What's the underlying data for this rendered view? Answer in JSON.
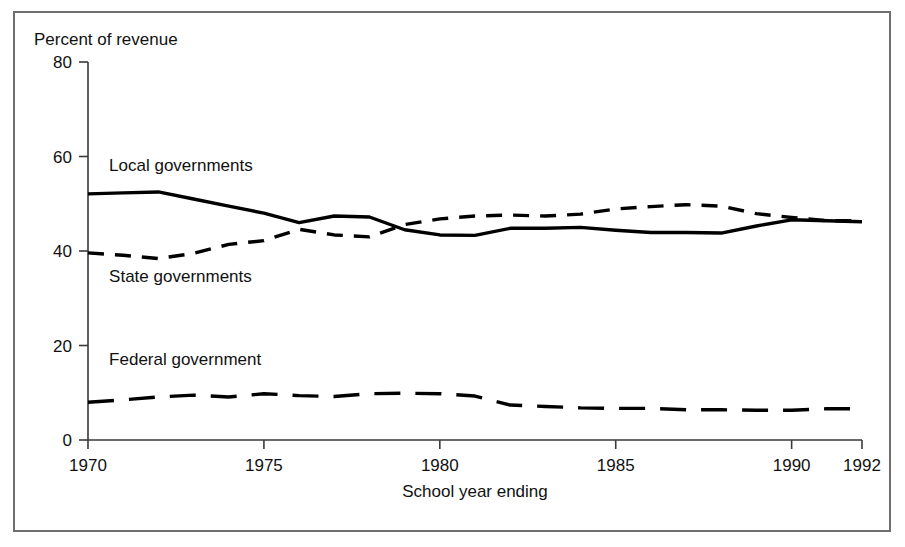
{
  "chart_data": {
    "type": "line",
    "title": "",
    "subtitle": "",
    "ylabel": "Percent of revenue",
    "xlabel": "School year ending",
    "xlim": [
      1970,
      1992
    ],
    "ylim": [
      0,
      80
    ],
    "xticks": [
      "1970",
      "1975",
      "1980",
      "1985",
      "1990",
      "1992"
    ],
    "xtick_values": [
      1970,
      1975,
      1980,
      1985,
      1990,
      1992
    ],
    "yticks": [
      "0",
      "20",
      "40",
      "60",
      "80"
    ],
    "ytick_values": [
      0,
      20,
      40,
      60,
      80
    ],
    "grid": false,
    "legend_position": "inline-annotations",
    "x": [
      1970,
      1971,
      1972,
      1973,
      1974,
      1975,
      1976,
      1977,
      1978,
      1979,
      1980,
      1981,
      1982,
      1983,
      1984,
      1985,
      1986,
      1987,
      1988,
      1989,
      1990,
      1991,
      1992
    ],
    "series": [
      {
        "name": "Local governments",
        "style": "solid",
        "color": "#000000",
        "values": [
          52.1,
          52.3,
          52.5,
          51.0,
          49.5,
          48.0,
          46.0,
          47.4,
          47.2,
          44.5,
          43.4,
          43.3,
          44.8,
          44.8,
          45.0,
          44.4,
          43.9,
          43.9,
          43.8,
          45.3,
          46.6,
          46.4,
          46.2
        ]
      },
      {
        "name": "State governments",
        "style": "dashed",
        "color": "#000000",
        "values": [
          39.6,
          39.1,
          38.4,
          39.5,
          41.4,
          42.2,
          44.6,
          43.4,
          43.0,
          45.6,
          46.8,
          47.4,
          47.6,
          47.4,
          47.8,
          48.9,
          49.4,
          49.8,
          49.5,
          47.9,
          47.1,
          46.4,
          46.4
        ]
      },
      {
        "name": "Federal government",
        "style": "long-dashed",
        "color": "#000000",
        "values": [
          8.0,
          8.5,
          9.1,
          9.5,
          9.1,
          9.8,
          9.4,
          9.2,
          9.8,
          9.9,
          9.8,
          9.3,
          7.4,
          7.1,
          6.8,
          6.7,
          6.7,
          6.4,
          6.4,
          6.3,
          6.3,
          6.6,
          6.6
        ]
      }
    ],
    "annotations": [
      {
        "text": "Local governments",
        "x": 1970.6,
        "y": 57.0
      },
      {
        "text": "State governments",
        "x": 1970.6,
        "y": 33.5
      },
      {
        "text": "Federal government",
        "x": 1970.6,
        "y": 15.8
      }
    ]
  }
}
